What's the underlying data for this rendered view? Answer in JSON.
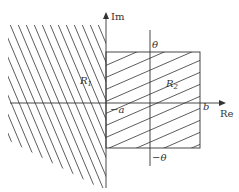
{
  "diagram": {
    "type": "complex-plane-regions",
    "axes": {
      "real_label": "Re",
      "imag_label": "Im"
    },
    "regions": [
      {
        "id": "R1",
        "label": "R",
        "subscript": "1",
        "hatch": "steep-descending"
      },
      {
        "id": "R2",
        "label": "R",
        "subscript": "2",
        "hatch": "shallow-ascending"
      }
    ],
    "labels": {
      "theta": "θ",
      "neg_theta": "−θ",
      "neg_a": "−a",
      "b": "b"
    },
    "colors": {
      "line": "#333333",
      "background": "#ffffff"
    }
  }
}
